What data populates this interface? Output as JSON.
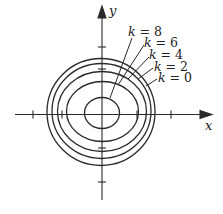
{
  "diagram": {
    "type": "level-curves",
    "colors": {
      "ink": "#2a2a2a",
      "background": "#ffffff"
    },
    "axes": {
      "x_label": "x",
      "y_label": "y",
      "origin": [
        102,
        113
      ],
      "x_range_px": [
        15,
        212
      ],
      "y_range_px": [
        7,
        200
      ],
      "x_ticks_px": [
        33,
        62,
        137,
        171
      ],
      "y_ticks_px": [
        47,
        69,
        148,
        182
      ]
    },
    "curves": [
      {
        "label": "k = 8",
        "var": "k",
        "value": "8",
        "rx": 17.5,
        "ry": 15.5,
        "leader": [
          [
            132,
            38
          ],
          [
            110,
            98
          ]
        ],
        "label_pos": [
          128,
          35
        ]
      },
      {
        "label": "k = 6",
        "var": "k",
        "value": "6",
        "rx": 36,
        "ry": 30,
        "leader": [
          [
            144,
            45
          ],
          [
            118,
            85
          ]
        ],
        "label_pos": [
          142,
          46
        ]
      },
      {
        "label": "k = 4",
        "var": "k",
        "value": "4",
        "rx": 44.5,
        "ry": 40,
        "leader": [
          [
            149,
            57
          ],
          [
            128,
            79
          ]
        ],
        "label_pos": [
          148,
          58
        ]
      },
      {
        "label": "k = 2",
        "var": "k",
        "value": "2",
        "rx": 49.5,
        "ry": 47.5,
        "leader": [
          [
            153,
            68
          ],
          [
            138,
            79
          ]
        ],
        "label_pos": [
          153,
          70
        ]
      },
      {
        "label": "k = 0",
        "var": "k",
        "value": "0",
        "rx": 54,
        "ry": 53.5,
        "leader": [
          [
            157,
            79
          ],
          [
            146,
            86
          ]
        ],
        "label_pos": [
          158,
          81
        ]
      }
    ]
  }
}
